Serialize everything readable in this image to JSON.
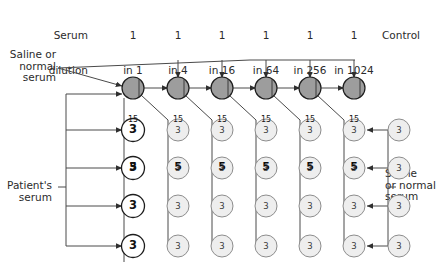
{
  "diagram": {
    "row_header": {
      "line1": "Serum",
      "line2": "dilution"
    },
    "columns": [
      {
        "id": "col1",
        "num": "1",
        "den": "in 1",
        "cx": 133
      },
      {
        "id": "col2",
        "num": "1",
        "den": "in 4",
        "cx": 178
      },
      {
        "id": "col3",
        "num": "1",
        "den": "in 16",
        "cx": 222
      },
      {
        "id": "col4",
        "num": "1",
        "den": "in 64",
        "cx": 266
      },
      {
        "id": "col5",
        "num": "1",
        "den": "in 256",
        "cx": 310
      },
      {
        "id": "col6",
        "num": "1",
        "den": "in 1024",
        "cx": 354
      },
      {
        "id": "col7",
        "num": "",
        "den": "",
        "cx": 399,
        "header": "Control"
      }
    ],
    "control_label": "Control",
    "top_left_label": "Saline or\nnormal\nserum",
    "left_label": "Patient's\nserum",
    "right_label": "Saline\nor normal\nserum",
    "top_row": {
      "y": 88,
      "value_top": "15",
      "value_bottom": "5",
      "fill": "#9d9d9d",
      "stroke": "#1d1d1d",
      "count": 6
    },
    "rows": [
      {
        "y": 130
      },
      {
        "y": 168
      },
      {
        "y": 206
      },
      {
        "y": 246
      }
    ],
    "well_value": "3",
    "colors": {
      "ink": "#2b2b2b",
      "line": "#4a4a4a",
      "well_gray_fill": "#eeeeee",
      "well_gray_stroke": "#8d8d8d",
      "well_white_fill": "#ffffff",
      "well_white_stroke": "#1d1d1d",
      "top_fill": "#9d9d9d",
      "top_stroke": "#1d1d1d"
    }
  }
}
